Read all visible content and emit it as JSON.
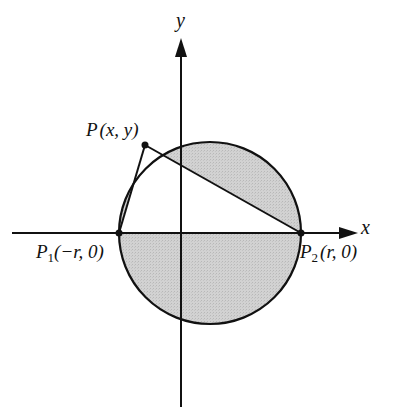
{
  "diagram": {
    "axes": {
      "x_label": "x",
      "y_label": "y"
    },
    "circle": {
      "cx": 210,
      "cy": 233,
      "r": 91,
      "fill": "#cfcfcf",
      "stroke": "#111111"
    },
    "points": {
      "P": {
        "name": "P",
        "coords": "(x, y)",
        "px": 145,
        "py": 145
      },
      "P1": {
        "name": "P",
        "sub": "1",
        "coords": "(−r, 0)",
        "px": 119,
        "py": 233
      },
      "P2": {
        "name": "P",
        "sub": "2",
        "coords": "(r, 0)",
        "px": 301,
        "py": 233
      }
    },
    "triangle": "P-P1-P2 (unshaded interior, inscribed in semicircle)"
  }
}
